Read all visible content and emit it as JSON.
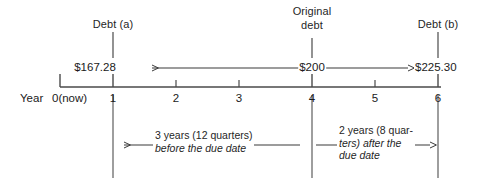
{
  "diagram": {
    "axis_label": "Year",
    "origin_label": "0(now)",
    "ticks": [
      {
        "value": 0,
        "label": ""
      },
      {
        "value": 1,
        "label": "1"
      },
      {
        "value": 2,
        "label": "2"
      },
      {
        "value": 3,
        "label": "3"
      },
      {
        "value": 4,
        "label": "4"
      },
      {
        "value": 5,
        "label": "5"
      },
      {
        "value": 6,
        "label": "6"
      }
    ],
    "markers": [
      {
        "id": "debt-a",
        "label": "Debt (a)",
        "year": 1,
        "amount": "$167.28"
      },
      {
        "id": "original-debt",
        "label_line1": "Original",
        "label_line2": "debt",
        "year": 4,
        "amount": "$200"
      },
      {
        "id": "debt-b",
        "label": "Debt (b)",
        "year": 6,
        "amount": "$225.30"
      }
    ],
    "annotations": [
      {
        "id": "before-due-date",
        "line1": "3 years (12 quarters)",
        "line2": "before the due date",
        "from_year": 4,
        "to_year": 1
      },
      {
        "id": "after-due-date",
        "line1": "2 years (8 quar-",
        "line2": "ters) after the",
        "line3": "due date",
        "from_year": 4,
        "to_year": 6
      }
    ],
    "colors": {
      "ink": "#1a1a1a",
      "rule": "#5a5a5a",
      "background": "#ffffff"
    }
  }
}
